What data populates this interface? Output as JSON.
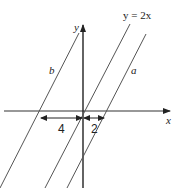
{
  "diagram": {
    "axes": {
      "x_label": "x",
      "y_label": "y"
    },
    "lines": [
      {
        "id": "b",
        "label": "b",
        "x_intercept": -4,
        "slope": 2
      },
      {
        "id": "center",
        "label": "y = 2x",
        "x_intercept": 0,
        "slope": 2
      },
      {
        "id": "a",
        "label": "a",
        "x_intercept": 2,
        "slope": 2
      }
    ],
    "dimensions": [
      {
        "label": "4",
        "from": -4,
        "to": 0
      },
      {
        "label": "2",
        "from": 0,
        "to": 2
      }
    ],
    "colors": {
      "line": "#555555",
      "axis": "#222222",
      "background": "#ffffff"
    }
  }
}
